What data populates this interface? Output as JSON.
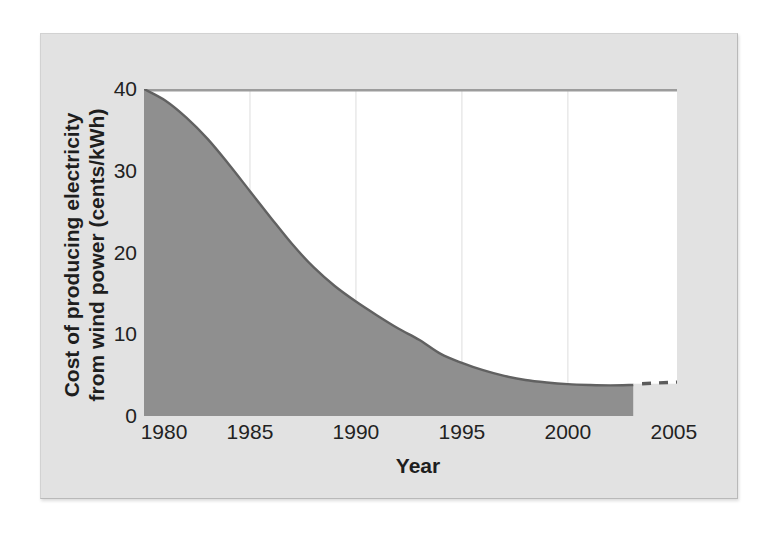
{
  "figure": {
    "background_color": "#ffffff",
    "panel_color": "#e2e2e2"
  },
  "chart_data": {
    "type": "area",
    "title": "",
    "xlabel": "Year",
    "ylabel_lines": [
      "Cost of producing electricity",
      "from wind power (cents/kWh)"
    ],
    "xlim": [
      1980,
      2005.15
    ],
    "ylim": [
      0,
      40
    ],
    "x_ticks": [
      "1980",
      "1985",
      "1990",
      "1995",
      "2000",
      "2005"
    ],
    "x_tick_values": [
      1980,
      1985,
      1990,
      1995,
      2000,
      2005
    ],
    "y_ticks": [
      "40",
      "30",
      "20",
      "10",
      "0"
    ],
    "y_tick_values": [
      40,
      30,
      20,
      10,
      0
    ],
    "grid": "vertical-light",
    "legend": "none",
    "series": [
      {
        "name": "historical-cost",
        "style": "filled-area",
        "points": [
          [
            1980,
            40
          ],
          [
            1981,
            38.6
          ],
          [
            1982,
            36.5
          ],
          [
            1983,
            33.9
          ],
          [
            1984,
            30.8
          ],
          [
            1985,
            27.5
          ],
          [
            1986,
            24.2
          ],
          [
            1987,
            21.0
          ],
          [
            1988,
            18.2
          ],
          [
            1989,
            15.9
          ],
          [
            1990,
            14.0
          ],
          [
            1991,
            12.3
          ],
          [
            1992,
            10.7
          ],
          [
            1993,
            9.3
          ],
          [
            1994,
            7.6
          ],
          [
            1995,
            6.5
          ],
          [
            1996,
            5.6
          ],
          [
            1997,
            4.9
          ],
          [
            1998,
            4.4
          ],
          [
            1999,
            4.1
          ],
          [
            2000,
            3.9
          ],
          [
            2001,
            3.8
          ],
          [
            2002,
            3.75
          ],
          [
            2003.1,
            3.8
          ]
        ]
      },
      {
        "name": "projected-cost",
        "style": "dashed-line",
        "points": [
          [
            2003.5,
            3.95
          ],
          [
            2005.15,
            4.15
          ]
        ]
      }
    ],
    "layout": {
      "first_x_label_shift": 20
    },
    "colors": {
      "plot_bg": "#ffffff",
      "panel_bg": "#e2e2e2",
      "area_fill": "#8f8f8f",
      "area_stroke": "#616161",
      "top_line": "#9c9c9c",
      "gridline": "#e7e7e7",
      "dash_line": "#5c5c5c",
      "text": "#1e1e1e"
    }
  }
}
